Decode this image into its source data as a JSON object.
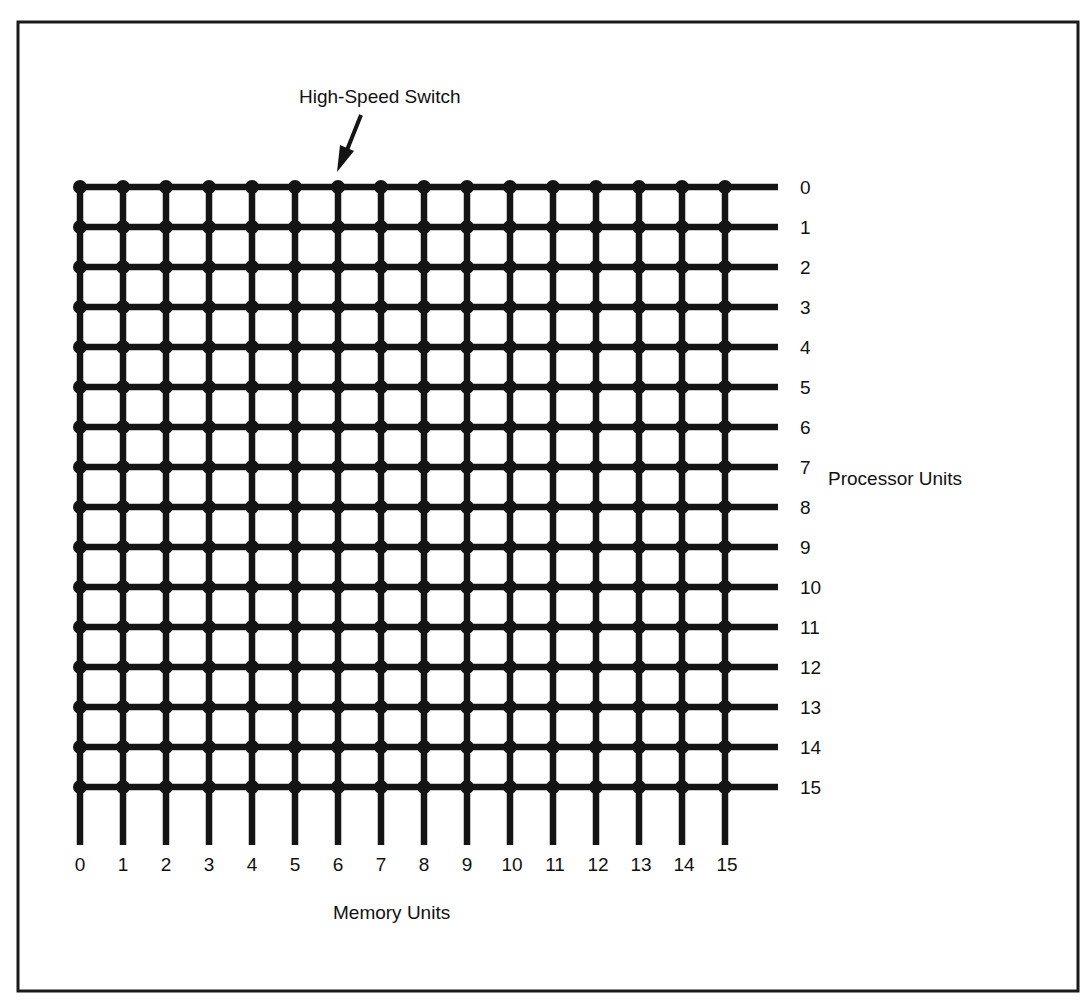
{
  "diagram": {
    "type": "crossbar-switch",
    "annotation": {
      "label": "High-Speed Switch",
      "points_to": {
        "memory_unit": 6,
        "processor_unit": 0
      }
    },
    "processor_axis": {
      "title": "Processor Units",
      "labels": [
        "0",
        "1",
        "2",
        "3",
        "4",
        "5",
        "6",
        "7",
        "8",
        "9",
        "10",
        "11",
        "12",
        "13",
        "14",
        "15"
      ]
    },
    "memory_axis": {
      "title": "Memory Units",
      "labels": [
        "0",
        "1",
        "2",
        "3",
        "4",
        "5",
        "6",
        "7",
        "8",
        "9",
        "10",
        "11",
        "12",
        "13",
        "14",
        "15"
      ]
    },
    "grid": {
      "rows": 16,
      "columns": 16,
      "switch_nodes": 256
    },
    "colors": {
      "ink": "#141414",
      "background": "#ffffff"
    }
  }
}
